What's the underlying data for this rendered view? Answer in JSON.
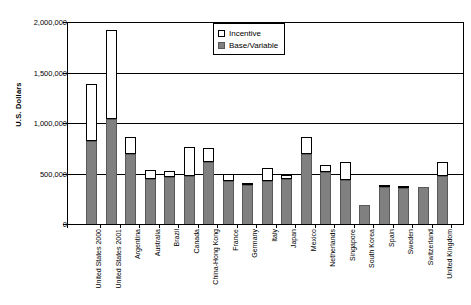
{
  "chart_data": {
    "type": "bar",
    "stacked": true,
    "title": "",
    "xlabel": "",
    "ylabel": "U.S. Dollars",
    "ylim": [
      0,
      2000000
    ],
    "ytick_values": [
      0,
      500000,
      1000000,
      1500000,
      2000000
    ],
    "ytick_labels": [
      "0",
      "500,000",
      "1,000,000",
      "1,500,000",
      "2,000,000"
    ],
    "grid": true,
    "legend_position": "top-center",
    "categories": [
      "United States 2000",
      "United States 2001",
      "Argentina",
      "Australia",
      "Brazil",
      "Canada",
      "China-Hong Kong",
      "France",
      "Germany",
      "Italy",
      "Japan",
      "Mexico",
      "Netherlands",
      "Singapore",
      "South Korea",
      "Spain",
      "Sweden",
      "Switzerland",
      "United Kingdom"
    ],
    "series": [
      {
        "name": "Base/Variable",
        "color": "#808080",
        "values": [
          830000,
          1050000,
          700000,
          455000,
          480000,
          490000,
          620000,
          440000,
          400000,
          440000,
          455000,
          700000,
          520000,
          450000,
          200000,
          380000,
          370000,
          380000,
          490000
        ]
      },
      {
        "name": "Incentive",
        "color": "#ffffff",
        "values": [
          570000,
          880000,
          175000,
          85000,
          50000,
          280000,
          140000,
          70000,
          15000,
          125000,
          45000,
          170000,
          75000,
          175000,
          0,
          20000,
          20000,
          0,
          135000
        ]
      }
    ],
    "totals": [
      1400000,
      1930000,
      875000,
      540000,
      530000,
      770000,
      760000,
      510000,
      415000,
      565000,
      500000,
      870000,
      595000,
      625000,
      200000,
      400000,
      390000,
      380000,
      625000
    ]
  },
  "legend": {
    "items": [
      {
        "label": "Incentive",
        "swatch": "open-square-swatch"
      },
      {
        "label": "Base/Variable",
        "swatch": "filled-square-swatch"
      }
    ]
  },
  "axes": {
    "y_title": "U.S. Dollars"
  },
  "colors": {
    "base_fill": "#808080",
    "base_stroke": "#595959",
    "incentive_fill": "#ffffff",
    "incentive_stroke": "#000000",
    "axis": "#000000",
    "background": "#ffffff"
  }
}
